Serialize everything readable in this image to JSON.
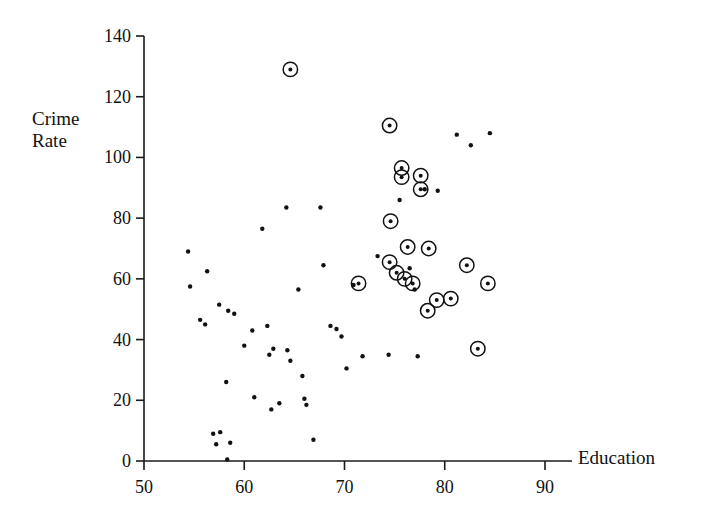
{
  "chart_data": {
    "type": "scatter",
    "title": "",
    "xlabel": "Education",
    "ylabel": "Crime\nRate",
    "ylabel_line1": "Crime",
    "ylabel_line2": "Rate",
    "xlim": [
      50,
      90
    ],
    "ylim": [
      0,
      140
    ],
    "xticks": [
      50,
      60,
      70,
      80,
      90
    ],
    "yticks": [
      0,
      20,
      40,
      60,
      80,
      100,
      120,
      140
    ],
    "grid": false,
    "legend": null,
    "series": [
      {
        "name": "plain-points",
        "marker": "dot",
        "points": [
          [
            54.4,
            69.0
          ],
          [
            54.6,
            57.5
          ],
          [
            56.3,
            62.5
          ],
          [
            55.6,
            46.5
          ],
          [
            56.1,
            45.0
          ],
          [
            57.5,
            51.5
          ],
          [
            58.4,
            49.5
          ],
          [
            59.0,
            48.5
          ],
          [
            58.2,
            26.0
          ],
          [
            56.9,
            9.0
          ],
          [
            57.6,
            9.5
          ],
          [
            57.2,
            5.5
          ],
          [
            58.6,
            6.0
          ],
          [
            58.3,
            0.5
          ],
          [
            60.0,
            38.0
          ],
          [
            60.8,
            43.0
          ],
          [
            61.0,
            21.0
          ],
          [
            61.8,
            76.5
          ],
          [
            62.3,
            44.5
          ],
          [
            62.5,
            35.0
          ],
          [
            62.9,
            37.0
          ],
          [
            62.7,
            17.0
          ],
          [
            63.5,
            19.0
          ],
          [
            64.2,
            83.5
          ],
          [
            64.3,
            36.5
          ],
          [
            64.6,
            33.0
          ],
          [
            65.4,
            56.5
          ],
          [
            65.8,
            28.0
          ],
          [
            66.0,
            20.5
          ],
          [
            66.2,
            18.5
          ],
          [
            66.9,
            7.0
          ],
          [
            67.6,
            83.5
          ],
          [
            67.9,
            64.5
          ],
          [
            68.6,
            44.5
          ],
          [
            69.2,
            43.5
          ],
          [
            69.7,
            41.0
          ],
          [
            70.2,
            30.5
          ],
          [
            70.9,
            58.0
          ],
          [
            71.8,
            34.5
          ],
          [
            73.3,
            67.5
          ],
          [
            74.4,
            35.0
          ],
          [
            75.5,
            86.0
          ],
          [
            76.5,
            63.5
          ],
          [
            77.0,
            56.5
          ],
          [
            77.3,
            34.5
          ],
          [
            78.0,
            89.5
          ],
          [
            79.3,
            89.0
          ],
          [
            81.2,
            107.5
          ],
          [
            82.6,
            104.0
          ],
          [
            84.5,
            108.0
          ]
        ]
      },
      {
        "name": "circled-points",
        "marker": "circled-dot",
        "points": [
          [
            64.6,
            129.0
          ],
          [
            74.5,
            110.5
          ],
          [
            75.7,
            96.5
          ],
          [
            75.7,
            93.5
          ],
          [
            77.6,
            94.0
          ],
          [
            77.6,
            89.5
          ],
          [
            74.6,
            79.0
          ],
          [
            71.4,
            58.5
          ],
          [
            76.3,
            70.5
          ],
          [
            78.4,
            70.0
          ],
          [
            74.5,
            65.5
          ],
          [
            75.2,
            62.0
          ],
          [
            76.0,
            60.0
          ],
          [
            76.8,
            58.5
          ],
          [
            79.2,
            53.0
          ],
          [
            80.6,
            53.5
          ],
          [
            78.3,
            49.5
          ],
          [
            82.2,
            64.5
          ],
          [
            84.3,
            58.5
          ],
          [
            83.3,
            37.0
          ]
        ]
      }
    ]
  },
  "axes": {
    "y_axis_name": "crime-rate-axis",
    "x_axis_name": "education-axis"
  }
}
